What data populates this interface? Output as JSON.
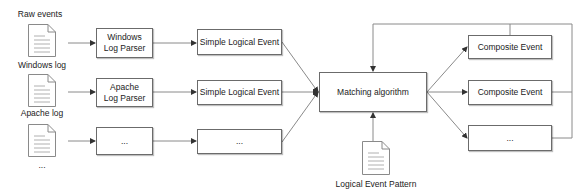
{
  "diagram": {
    "title_label": "Raw events",
    "sources": [
      {
        "label": "Windows log",
        "icon": "document-icon"
      },
      {
        "label": "Apache log",
        "icon": "document-icon"
      },
      {
        "label": "...",
        "icon": "document-icon"
      }
    ],
    "parsers": [
      {
        "line1": "Windows",
        "line2": "Log Parser"
      },
      {
        "line1": "Apache",
        "line2": "Log Parser"
      },
      {
        "line1": "...",
        "line2": ""
      }
    ],
    "simple_events": [
      {
        "label": "Simple Logical Event"
      },
      {
        "label": "Simple Logical Event"
      },
      {
        "label": "..."
      }
    ],
    "matcher": {
      "label": "Matching algorithm"
    },
    "pattern": {
      "label": "Logical Event Pattern",
      "icon": "document-icon"
    },
    "composite_events": [
      {
        "label": "Composite Event"
      },
      {
        "label": "Composite Event"
      },
      {
        "label": "..."
      }
    ],
    "colors": {
      "line": "#8a8a8a",
      "border": "#6b6b6b",
      "text": "#222222"
    }
  }
}
